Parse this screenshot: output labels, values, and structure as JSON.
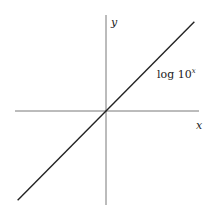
{
  "chart_data": {
    "type": "line",
    "title": "",
    "xlabel": "x",
    "ylabel": "y",
    "grid": false,
    "xlim": [
      -1,
      1
    ],
    "ylim": [
      -1,
      1
    ],
    "series": [
      {
        "name": "log 10^x",
        "label_base": "log 10",
        "label_exponent": "x",
        "x": [
          -0.95,
          0.95
        ],
        "y": [
          -0.95,
          0.95
        ]
      }
    ],
    "annotations": [
      {
        "text": "log 10^x",
        "position": "upper-right, beside the line"
      }
    ]
  }
}
